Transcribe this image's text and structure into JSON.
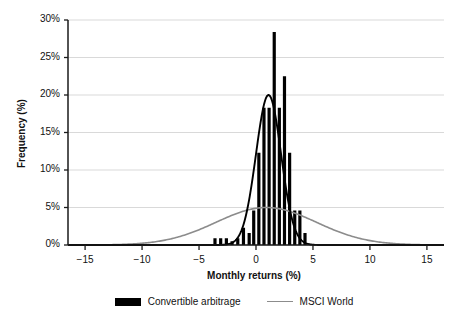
{
  "chart_data": {
    "type": "bar",
    "title": "",
    "xlabel": "Monthly returns (%)",
    "ylabel": "Frequency (%)",
    "xlim": [
      -16.5,
      16.5
    ],
    "ylim": [
      0,
      30
    ],
    "xticks": [
      -15,
      -10,
      -5,
      0,
      5,
      10,
      15
    ],
    "xtick_labels": [
      "−15",
      "−10",
      "−5",
      "0",
      "5",
      "10",
      "15"
    ],
    "yticks": [
      0,
      5,
      10,
      15,
      20,
      25,
      30
    ],
    "ytick_labels": [
      "0%",
      "5%",
      "10%",
      "15%",
      "20%",
      "25%",
      "30%"
    ],
    "grid": true,
    "legend_position": "bottom",
    "series": [
      {
        "name": "Convertible arbitrage",
        "type": "bar",
        "color": "#000000",
        "bar_width": 0.28,
        "x": [
          -3.6,
          -3.1,
          -2.6,
          -2.1,
          -1.6,
          -1.1,
          -0.6,
          -0.2,
          0.25,
          0.7,
          1.15,
          1.6,
          2.05,
          2.5,
          2.95,
          3.4,
          3.85,
          4.3
        ],
        "values": [
          0.9,
          0.9,
          0.9,
          0.5,
          0.9,
          2.3,
          1.6,
          4.6,
          12.3,
          18.3,
          18.3,
          28.4,
          18.3,
          22.5,
          12.3,
          4.6,
          4.6,
          1.6
        ]
      },
      {
        "name": "MSCI World",
        "type": "line",
        "color": "#8c8c8c",
        "distribution": "normal",
        "mean": 0.9,
        "std_dev": 4.4,
        "peak_value": 5.0
      },
      {
        "name": "Convertible arbitrage fitted curve",
        "type": "line",
        "color": "#000000",
        "distribution": "normal",
        "mean": 1.1,
        "std_dev": 1.1,
        "peak_value": 20.0
      }
    ]
  },
  "legend": {
    "items": [
      {
        "label": "Convertible arbitrage",
        "marker": "filled-bar",
        "color": "#000000"
      },
      {
        "label": "MSCI World",
        "marker": "line",
        "color": "#8c8c8c"
      }
    ]
  },
  "axes": {
    "x_title": "Monthly returns (%)",
    "y_title": "Frequency (%)"
  }
}
